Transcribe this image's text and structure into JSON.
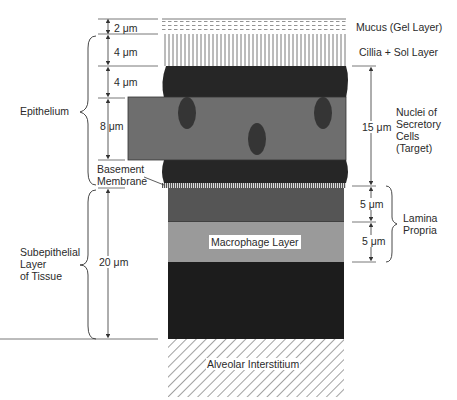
{
  "diagram": {
    "title": "",
    "layers": [
      {
        "name": "Mucus (Gel Layer)",
        "thickness": "2 μm"
      },
      {
        "name": "Cillia + Sol Layer",
        "thickness": "4 μm"
      },
      {
        "name": "Epithelium upper",
        "thickness": "4 μm"
      },
      {
        "name": "Secretory cell band",
        "thickness": "8 μm"
      },
      {
        "name": "Basement Membrane"
      },
      {
        "name": "Lamina Propria upper",
        "thickness": "5 μm"
      },
      {
        "name": "Macrophage Layer",
        "thickness": "5 μm"
      },
      {
        "name": "Subepithelial Layer of Tissue",
        "thickness": "20 μm"
      },
      {
        "name": "Alveolar Interstitium"
      }
    ],
    "left_labels": {
      "dim_2": "2 μm",
      "dim_4a": "4 μm",
      "dim_4b": "4 μm",
      "dim_8": "8 μm",
      "dim_20": "20 μm",
      "epithelium": "Epithelium",
      "basement_1": "Basement",
      "basement_2": "Membrane",
      "subepi_1": "Subepithelial",
      "subepi_2": "Layer",
      "subepi_3": "of Tissue"
    },
    "right_labels": {
      "mucus": "Mucus (Gel Layer)",
      "cilia": "Cillia + Sol Layer",
      "dim_15": "15 μm",
      "nuclei_1": "Nuclei of",
      "nuclei_2": "Secretory",
      "nuclei_3": "Cells",
      "nuclei_4": "(Target)",
      "dim_5a": "5 μm",
      "dim_5b": "5 μm",
      "lamina_1": "Lamina",
      "lamina_2": "Propria"
    },
    "inner_labels": {
      "macrophage": "Macrophage Layer",
      "alveolar": "Alveolar Interstitium"
    },
    "colors": {
      "dark_tissue": "#262626",
      "secretory_band": "#6e6e6e",
      "nucleus": "#353535",
      "lamina_upper": "#555555",
      "macrophage": "#9a9a9a",
      "line": "#333333"
    }
  }
}
